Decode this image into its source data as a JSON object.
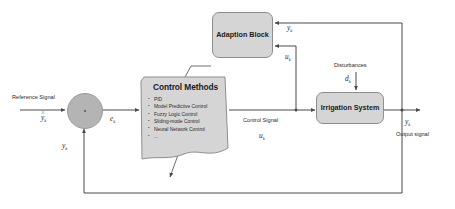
{
  "diagram": {
    "type": "block-diagram",
    "background_color": "#ffffff",
    "block_fill_color": "#d5d5d5",
    "block_border_color": "#8e8e8e",
    "junction_fill_color": "#b4b4b4",
    "wire_color": "#4a4a4a"
  },
  "blocks": {
    "adaption": {
      "label": "Adaption Block"
    },
    "irrigation": {
      "label": "Irrigation System"
    },
    "control_methods": {
      "title": "Control Methods",
      "items": [
        "PID",
        "Model Predictive Control",
        "Fuzzy Logic Control",
        "Sliding-mode Control",
        "Neural Network Control",
        "..."
      ]
    },
    "summing_junction": {
      "label": ""
    }
  },
  "signals": {
    "reference_signal_label": "Reference Signal",
    "reference_symbol": "y",
    "reference_symbol_sub": "k",
    "error_symbol": "e",
    "error_symbol_sub": "k",
    "feedback_symbol": "y",
    "feedback_symbol_sub": "k",
    "control_signal_label": "Control Signal",
    "control_symbol": "u",
    "control_symbol_sub": "k",
    "adapt_output_symbol": "y",
    "adapt_output_symbol_sub": "k",
    "adapt_input_symbol": "u",
    "adapt_input_symbol_sub": "k",
    "disturbances_label": "Disturbances",
    "disturbance_symbol": "d",
    "disturbance_symbol_sub": "k",
    "output_symbol": "y",
    "output_symbol_sub": "k",
    "output_signal_label": "Output signal"
  }
}
